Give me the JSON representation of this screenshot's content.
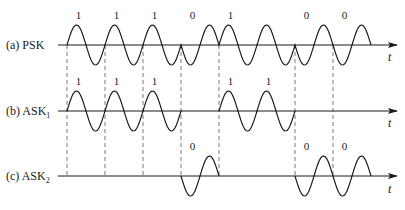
{
  "diagram": {
    "type": "digital-modulation-waveforms",
    "time_axis_label": "t",
    "bit_sequence": [
      1,
      1,
      1,
      0,
      1,
      1,
      0,
      0
    ],
    "bit_boundaries_x": [
      67,
      105,
      143,
      181,
      219,
      257,
      295,
      333,
      371
    ],
    "colors": {
      "line": "#1a1a1a",
      "dashed": "#555555",
      "background": "#ffffff"
    },
    "rows": [
      {
        "id": "psk",
        "label": "(a)  PSK",
        "axis_y": 45,
        "bit_labels": [
          {
            "text": "1",
            "bit_index": 0
          },
          {
            "text": "1",
            "bit_index": 1
          },
          {
            "text": "1",
            "bit_index": 2
          },
          {
            "text": "0",
            "bit_index": 3
          },
          {
            "text": "1",
            "bit_index": 4
          },
          {
            "text": "0",
            "bit_index": 6
          },
          {
            "text": "0",
            "bit_index": 7
          }
        ]
      },
      {
        "id": "ask1",
        "label": "(b)  ASK",
        "label_sub": "1",
        "axis_y": 111,
        "bit_labels": [
          {
            "text": "1",
            "bit_index": 0
          },
          {
            "text": "1",
            "bit_index": 1
          },
          {
            "text": "1",
            "bit_index": 2
          },
          {
            "text": "1",
            "bit_index": 4
          },
          {
            "text": "1",
            "bit_index": 5
          }
        ]
      },
      {
        "id": "ask2",
        "label": "(c)  ASK",
        "label_sub": "2",
        "axis_y": 176,
        "bit_labels": [
          {
            "text": "0",
            "bit_index": 3
          },
          {
            "text": "0",
            "bit_index": 6
          },
          {
            "text": "0",
            "bit_index": 7
          }
        ]
      }
    ]
  }
}
